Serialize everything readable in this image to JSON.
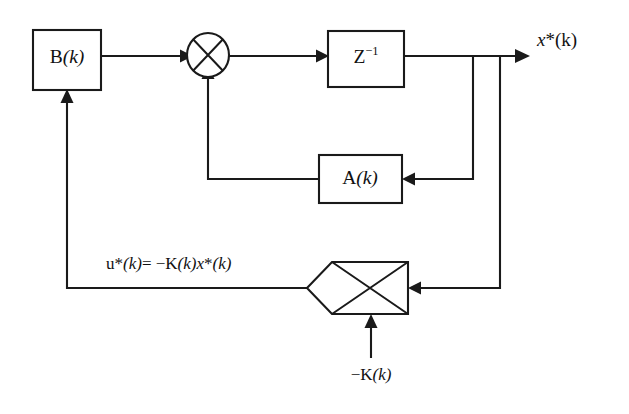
{
  "diagram": {
    "line_color": "#1a1a1a",
    "background_color": "#ffffff",
    "blocks": [
      {
        "id": "input-gain-block",
        "name": "B(k)",
        "label_roman": "B",
        "label_italic": "(k)",
        "shape": "rectangle",
        "x": 33,
        "y": 30,
        "width": 68,
        "height": 60
      },
      {
        "id": "delay-block",
        "name": "Z^-1",
        "label_roman": "Z",
        "label_superscript": "−1",
        "shape": "rectangle",
        "x": 328,
        "y": 31,
        "width": 76,
        "height": 56
      },
      {
        "id": "system-matrix-block",
        "name": "A(k)",
        "label_roman": "A",
        "label_italic": "(k)",
        "shape": "rectangle",
        "x": 319,
        "y": 155,
        "width": 83,
        "height": 48
      },
      {
        "id": "feedback-gain-block",
        "name": "gain element",
        "shape": "crossed-rectangle-with-left-vertex",
        "x": 332,
        "y": 262,
        "width": 76,
        "height": 52
      }
    ],
    "summing_junction": {
      "id": "summing-junction",
      "name": "summing junction",
      "shape": "circle-with-cross",
      "cx": 208,
      "cy": 55,
      "rx": 21,
      "ry": 22
    },
    "labels": {
      "output_signal": {
        "text": "x*(k)",
        "italic_part": "x",
        "roman_part": "*(k)",
        "x": 537,
        "y": 42
      },
      "control_law": {
        "text": "u*(k)= −K(k)x*(k)",
        "segments": [
          {
            "t": "u",
            "style": "upright"
          },
          {
            "t": "*",
            "style": "upright"
          },
          {
            "t": "(k)",
            "style": "italic"
          },
          {
            "t": "= ",
            "style": "upright"
          },
          {
            "t": "−K",
            "style": "upright"
          },
          {
            "t": "(k)",
            "style": "italic"
          },
          {
            "t": "x",
            "style": "italic"
          },
          {
            "t": "*",
            "style": "upright"
          },
          {
            "t": "(k)",
            "style": "italic"
          }
        ],
        "x": 106,
        "y": 265
      },
      "gain_input": {
        "text": "−K(k)",
        "roman_part": "−K",
        "italic_part": "(k)",
        "x": 371,
        "y": 376
      }
    },
    "signal_paths": [
      {
        "id": "path-b-to-sum",
        "from": "input-gain-block",
        "to": "summing-junction",
        "arrow": true
      },
      {
        "id": "path-sum-to-delay",
        "from": "summing-junction",
        "to": "delay-block",
        "arrow": true
      },
      {
        "id": "path-delay-to-output",
        "from": "delay-block",
        "to": "output-signal",
        "arrow": true
      },
      {
        "id": "path-state-to-a",
        "from": "delay-block",
        "to": "system-matrix-block",
        "arrow": true
      },
      {
        "id": "path-a-to-sum",
        "from": "system-matrix-block",
        "to": "summing-junction",
        "arrow": true
      },
      {
        "id": "path-state-to-gain",
        "from": "delay-block",
        "to": "feedback-gain-block",
        "arrow": true
      },
      {
        "id": "path-gain-to-b",
        "from": "feedback-gain-block",
        "to": "input-gain-block",
        "arrow": true
      },
      {
        "id": "path-k-into-gain",
        "from": "gain-input-label",
        "to": "feedback-gain-block",
        "arrow": true
      }
    ]
  }
}
